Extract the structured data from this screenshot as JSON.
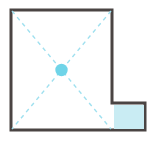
{
  "canvas": {
    "width": 156,
    "height": 145,
    "background": "#ffffff"
  },
  "diagram": {
    "type": "floor-plan-outline",
    "shape": {
      "name": "l-shaped-room-outline",
      "stroke_color": "#4a4443",
      "stroke_width": 3,
      "fill_color": "#ffffff",
      "points": "11,10 112,10 112,103 145,103 145,130 11,130"
    },
    "notch": {
      "name": "bottom-right-extension",
      "fill_color": "#c9ecf3",
      "x": 114,
      "y": 105,
      "width": 30,
      "height": 24
    },
    "guides": {
      "name": "diagonal-guide-lines",
      "stroke_color": "#9fe0ef",
      "stroke_width": 1.4,
      "dash_pattern": "4 4",
      "lines": [
        {
          "x1": 12,
          "y1": 11,
          "x2": 111,
          "y2": 129
        },
        {
          "x1": 111,
          "y1": 11,
          "x2": 12,
          "y2": 129
        }
      ]
    },
    "center_marker": {
      "name": "center-point-handle",
      "fill_color": "#6fd4e8",
      "cx": 61.5,
      "cy": 70,
      "r": 6.2
    }
  }
}
